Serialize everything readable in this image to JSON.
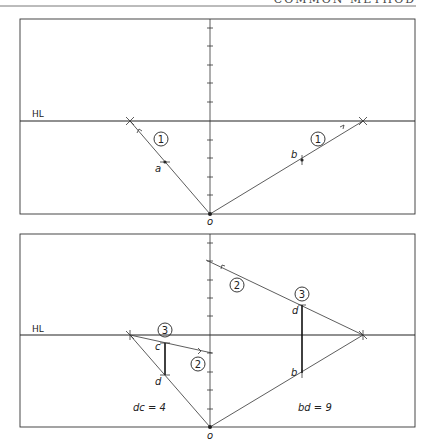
{
  "header": {
    "running_title": "COMMON METHOD"
  },
  "top_panel": {
    "horizon_label": "HL",
    "origin_label": "o",
    "point_a_label": "a",
    "point_b_label": "b",
    "step_left": "1",
    "step_right": "1"
  },
  "bottom_panel": {
    "horizon_label": "HL",
    "origin_label": "o",
    "label_c": "c",
    "label_d_left": "d",
    "label_d_right": "d",
    "label_b": "b",
    "step_2_upper": "2",
    "step_2_lower": "2",
    "step_3_left": "3",
    "step_3_right": "3",
    "measure_left": "dc = 4",
    "measure_right": "bd = 9"
  },
  "colors": {
    "ink": "#222222",
    "frame": "#333333",
    "paper": "#ffffff"
  }
}
